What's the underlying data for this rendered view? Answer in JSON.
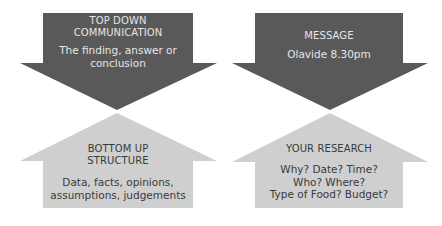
{
  "colors": {
    "dark_arrow": "#595959",
    "light_arrow": "#cfcfcf",
    "background": "#ffffff"
  },
  "panels": [
    {
      "name": "left",
      "down_arrow": {
        "title": [
          "TOP DOWN",
          "COMMUNICATION"
        ],
        "body": [
          "The finding, answer or",
          "conclusion"
        ]
      },
      "up_arrow": {
        "title": [
          "BOTTOM UP",
          "STRUCTURE"
        ],
        "body": [
          "Data, facts, opinions,",
          "assumptions, judgements"
        ]
      }
    },
    {
      "name": "right",
      "down_arrow": {
        "title": [
          "MESSAGE"
        ],
        "body": [
          "Olavide 8.30pm"
        ]
      },
      "up_arrow": {
        "title": [
          "YOUR RESEARCH"
        ],
        "body": [
          "Why? Date? Time?",
          "Who? Where?",
          "Type of Food? Budget?"
        ]
      }
    }
  ]
}
